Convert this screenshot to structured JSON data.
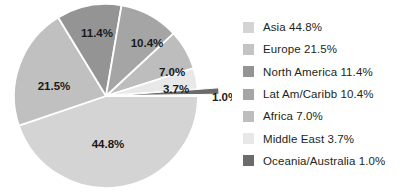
{
  "chart_data": {
    "type": "pie",
    "title": "",
    "unit": "%",
    "legend_position": "right",
    "start_angle_deg": 0,
    "direction": "clockwise",
    "categories": [
      "Asia",
      "Europe",
      "North America",
      "Lat Am/Caribb",
      "Africa",
      "Middle East",
      "Oceania/Australia"
    ],
    "values": [
      44.8,
      21.5,
      11.4,
      10.4,
      7.0,
      3.7,
      1.0
    ],
    "colors": [
      "#d4d4d4",
      "#c0c0c0",
      "#949494",
      "#a5a5a5",
      "#bdbdbd",
      "#e8e8e8",
      "#6b6b6b"
    ],
    "slice_labels": [
      "44.8%",
      "21.5%",
      "11.4%",
      "10.4%",
      "7.0%",
      "3.7%",
      "1.0%"
    ],
    "legend_labels": [
      "Asia 44.8%",
      "Europe 21.5%",
      "North America 11.4%",
      "Lat Am/Caribb 10.4%",
      "Africa 7.0%",
      "Middle East 3.7%",
      "Oceania/Australia 1.0%"
    ]
  },
  "pie": {
    "slices": [
      {
        "name": "africa",
        "label": "7.0%",
        "label_x": 172,
        "label_y": 76,
        "label_anchor": "middle",
        "inside": true
      },
      {
        "name": "middle-east",
        "label": "3.7%",
        "label_x": 176,
        "label_y": 93,
        "label_anchor": "middle",
        "inside": true
      },
      {
        "name": "oceania-australia",
        "label": "1.0%",
        "label_x": 212,
        "label_y": 101,
        "label_anchor": "start",
        "inside": false
      },
      {
        "name": "asia",
        "label": "44.8%",
        "label_x": 108,
        "label_y": 148,
        "label_anchor": "middle",
        "inside": true
      },
      {
        "name": "europe",
        "label": "21.5%",
        "label_x": 54,
        "label_y": 90,
        "label_anchor": "middle",
        "inside": true
      },
      {
        "name": "north-america",
        "label": "11.4%",
        "label_x": 97,
        "label_y": 37,
        "label_anchor": "middle",
        "inside": true
      },
      {
        "name": "lat-am-caribb",
        "label": "10.4%",
        "label_x": 147,
        "label_y": 47,
        "label_anchor": "middle",
        "inside": true
      }
    ]
  },
  "legend": {
    "items": [
      {
        "name": "asia",
        "label": "Asia 44.8%",
        "color": "#d4d4d4"
      },
      {
        "name": "europe",
        "label": "Europe 21.5%",
        "color": "#c3c3c3"
      },
      {
        "name": "north-america",
        "label": "North America 11.4%",
        "color": "#949494"
      },
      {
        "name": "lat-am-caribb",
        "label": "Lat Am/Caribb 10.4%",
        "color": "#a5a5a5"
      },
      {
        "name": "africa",
        "label": "Africa 7.0%",
        "color": "#bdbdbd"
      },
      {
        "name": "middle-east",
        "label": "Middle East 3.7%",
        "color": "#e8e8e8"
      },
      {
        "name": "oceania-australia",
        "label": "Oceania/Australia 1.0%",
        "color": "#6b6b6b"
      }
    ]
  }
}
